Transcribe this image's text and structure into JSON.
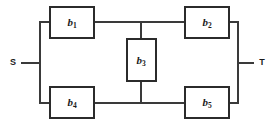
{
  "diagram": {
    "type": "reliability-block-diagram",
    "background_color": "#ffffff",
    "line_color": "#3a3a3a",
    "block_border_color": "#2b2b2b",
    "block_fill_color": "#ffffff",
    "label_color": "#1a1a1a",
    "terminals": [
      {
        "id": "S",
        "label": "S",
        "role": "source",
        "x": 13,
        "y": 63
      },
      {
        "id": "T",
        "label": "T",
        "role": "sink",
        "x": 262,
        "y": 63
      }
    ],
    "blocks": [
      {
        "id": "b1",
        "label_base": "b",
        "label_sub": "1",
        "x": 50,
        "y": 7,
        "width": 44,
        "height": 31,
        "label_x": 72,
        "label_y": 23
      },
      {
        "id": "b2",
        "label_base": "b",
        "label_sub": "2",
        "x": 185,
        "y": 7,
        "width": 44,
        "height": 31,
        "label_x": 207,
        "label_y": 23
      },
      {
        "id": "b3",
        "label_base": "b",
        "label_sub": "3",
        "x": 127,
        "y": 39,
        "width": 29,
        "height": 42,
        "label_x": 141,
        "label_y": 61
      },
      {
        "id": "b4",
        "label_base": "b",
        "label_sub": "4",
        "x": 50,
        "y": 87,
        "width": 44,
        "height": 31,
        "label_x": 72,
        "label_y": 103
      },
      {
        "id": "b5",
        "label_base": "b",
        "label_sub": "5",
        "x": 185,
        "y": 87,
        "width": 44,
        "height": 31,
        "label_x": 207,
        "label_y": 103
      }
    ],
    "wires": [
      {
        "id": "source-lead",
        "from": "S",
        "to": "left-bus",
        "path": "M 22 63 L 40 63"
      },
      {
        "id": "left-bus",
        "from": "left-bus-top",
        "to": "left-bus-bottom",
        "path": "M 40 22 L 40 103"
      },
      {
        "id": "left-bus-to-b1",
        "from": "left-bus",
        "to": "b1",
        "path": "M 40 22 L 50 22"
      },
      {
        "id": "left-bus-to-b4",
        "from": "left-bus",
        "to": "b4",
        "path": "M 40 103 L 50 103"
      },
      {
        "id": "b1-to-b2",
        "from": "b1",
        "to": "b2",
        "path": "M 94 22 L 185 22"
      },
      {
        "id": "b4-to-b5",
        "from": "b4",
        "to": "b5",
        "path": "M 94 103 L 185 103"
      },
      {
        "id": "top-to-b3",
        "from": "top-rail",
        "to": "b3",
        "path": "M 141 22 L 141 39"
      },
      {
        "id": "b3-to-bottom",
        "from": "b3",
        "to": "bottom-rail",
        "path": "M 141 81 L 141 103"
      },
      {
        "id": "b2-to-right-bus",
        "from": "b2",
        "to": "right-bus",
        "path": "M 229 22 L 238 22"
      },
      {
        "id": "b5-to-right-bus",
        "from": "b5",
        "to": "right-bus",
        "path": "M 229 103 L 238 103"
      },
      {
        "id": "right-bus",
        "from": "right-bus-top",
        "to": "right-bus-bottom",
        "path": "M 238 22 L 238 103"
      },
      {
        "id": "sink-lead",
        "from": "right-bus",
        "to": "T",
        "path": "M 238 63 L 253 63"
      }
    ]
  }
}
